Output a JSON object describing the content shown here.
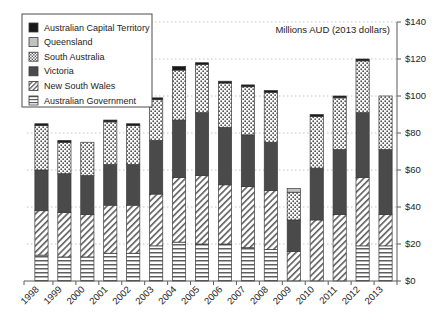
{
  "chart_data": {
    "type": "bar",
    "subtype": "stacked-vertical",
    "title": "Millions AUD (2013 dollars)",
    "xlabel": "",
    "ylabel": "",
    "ylim": [
      0,
      140
    ],
    "ytick_step": 20,
    "ytick_labels": [
      "$0",
      "$20",
      "$40",
      "$60",
      "$80",
      "$100",
      "$120",
      "$140"
    ],
    "ytick_values": [
      0,
      20,
      40,
      60,
      80,
      100,
      120,
      140
    ],
    "grid": true,
    "grid_axis": "y",
    "grid_style": "dotted",
    "legend_position": "top-left",
    "categories": [
      "1998",
      "1999",
      "2000",
      "2001",
      "2002",
      "2003",
      "2004",
      "2005",
      "2006",
      "2007",
      "2008",
      "2009",
      "2010",
      "2011",
      "2012",
      "2013"
    ],
    "stack_order_bottom_to_top": [
      "Australian Government",
      "New South Wales",
      "Victoria",
      "South Australia",
      "Queensland",
      "Australian Capital Territory"
    ],
    "series": [
      {
        "name": "Australian Government",
        "pattern": "horizontal-lines",
        "values": [
          14,
          13,
          13,
          15,
          15,
          19,
          21,
          20,
          20,
          18,
          17,
          0,
          0,
          0,
          19,
          19
        ]
      },
      {
        "name": "New South Wales",
        "pattern": "diagonal-hatch",
        "values": [
          24,
          24,
          23,
          26,
          26,
          28,
          35,
          37,
          32,
          33,
          32,
          16,
          33,
          36,
          37,
          17
        ]
      },
      {
        "name": "Victoria",
        "pattern": "solid-dark-gray",
        "values": [
          22,
          21,
          21,
          22,
          22,
          29,
          31,
          34,
          31,
          28,
          26,
          17,
          28,
          35,
          35,
          35
        ]
      },
      {
        "name": "South Australia",
        "pattern": "dotted",
        "values": [
          24,
          17,
          18,
          23,
          21,
          22,
          27,
          26,
          24,
          26,
          27,
          15,
          28,
          28,
          28,
          29
        ]
      },
      {
        "name": "Queensland",
        "pattern": "light-gray",
        "values": [
          0,
          0,
          0,
          0,
          0,
          0,
          0,
          0,
          0,
          0,
          0,
          2,
          0,
          0,
          0,
          0
        ]
      },
      {
        "name": "Australian Capital Territory",
        "pattern": "solid-black",
        "values": [
          1,
          1,
          0,
          1,
          1,
          1,
          2,
          1,
          1,
          1,
          1,
          0,
          1,
          1,
          1,
          0
        ]
      }
    ],
    "totals": [
      85,
      76,
      75,
      87,
      85,
      99,
      116,
      118,
      108,
      106,
      103,
      50,
      90,
      100,
      120,
      100
    ],
    "legend_entries": [
      {
        "label": "Australian Capital Territory",
        "pattern": "solid-black"
      },
      {
        "label": "Queensland",
        "pattern": "light-gray"
      },
      {
        "label": "South Australia",
        "pattern": "dotted"
      },
      {
        "label": "Victoria",
        "pattern": "solid-dark-gray"
      },
      {
        "label": "New South Wales",
        "pattern": "diagonal-hatch"
      },
      {
        "label": "Australian Government",
        "pattern": "horizontal-lines"
      }
    ],
    "colors": {
      "solid-black": "#181818",
      "light-gray": "#c2c2c2",
      "dotted": "#ffffff",
      "solid-dark-gray": "#4a4a4a",
      "diagonal-hatch": "#ffffff",
      "horizontal-lines": "#ffffff",
      "axis": "#5a5a5a",
      "grid": "#b5b5b5",
      "text": "#1c1c1c"
    }
  }
}
